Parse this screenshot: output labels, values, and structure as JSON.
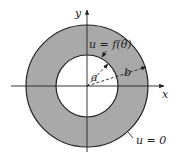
{
  "diagram": {
    "type": "annulus",
    "colors": {
      "region": "#a9a9a9",
      "stroke": "#222222",
      "background": "#ffffff"
    },
    "axes": {
      "x_label": "x",
      "y_label": "y"
    },
    "radii": {
      "inner_label": "a",
      "outer_label": "b"
    },
    "boundary_conditions": {
      "inner": "u = f(θ)",
      "outer": "u = 0"
    }
  }
}
